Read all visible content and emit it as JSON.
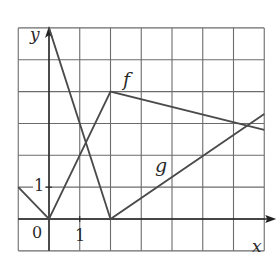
{
  "figure": {
    "type": "function-graph",
    "grid": {
      "x_min": -1,
      "x_max": 7,
      "y_min": -1,
      "y_max": 6,
      "step": 1
    },
    "axes": {
      "x_label": "x",
      "y_label": "y",
      "origin_label": "0",
      "x_tick_label": "1",
      "y_tick_label": "1"
    },
    "colors": {
      "grid": "#6b6b6b",
      "axis": "#222222",
      "curve": "#4a4a4a",
      "background": "#ffffff"
    }
  },
  "curves": [
    {
      "name": "f",
      "label": "f",
      "points": [
        [
          -1,
          1
        ],
        [
          0,
          0
        ],
        [
          2,
          4
        ],
        [
          7,
          2.8
        ]
      ]
    },
    {
      "name": "g",
      "label": "g",
      "points": [
        [
          0,
          6
        ],
        [
          2,
          0
        ],
        [
          7,
          3.3
        ]
      ]
    }
  ]
}
